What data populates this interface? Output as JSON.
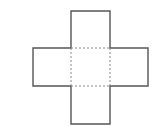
{
  "diagram": {
    "type": "cube-net-cross",
    "colors": {
      "background": "#ffffff",
      "solid_edge": "#555555",
      "fold_line": "#8a8a8a"
    },
    "center_square": {
      "x1": 71,
      "y1": 48,
      "x2": 110,
      "y2": 86
    },
    "outline_points": "71,11 110,11 110,48 148,48 148,86 110,86 110,124 71,124 71,86 33,86 33,48 71,48",
    "faces": [
      "top",
      "left",
      "center",
      "right",
      "bottom"
    ]
  }
}
